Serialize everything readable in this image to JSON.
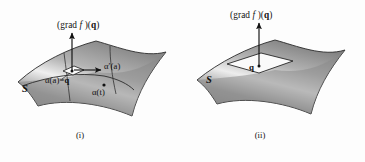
{
  "background_color": "#fdfdfd",
  "ink_color": "#111111",
  "surface": {
    "fill_light": "#f2f2f2",
    "fill_mid": "#9a9a9a",
    "fill_dark": "#6f6f6f",
    "outline": "#2b2b2b"
  },
  "figures": [
    {
      "id": "i",
      "caption": "(i)",
      "surface_label": "S",
      "gradient_vector_label": {
        "full": "(grad f )(q)",
        "prefix": "(grad ",
        "function": "f",
        "middle": " )(",
        "point": "q",
        "suffix": ")"
      },
      "tangent_vector_label": {
        "full": "α′(a)",
        "alpha": "α",
        "prime": "′",
        "arg": "(a)"
      },
      "base_point_label": {
        "full": "α(a)=q",
        "alpha_arg": "α(a)=",
        "point": "q"
      },
      "curve_label": {
        "full": "α(t)",
        "text": "α(t)"
      }
    },
    {
      "id": "ii",
      "caption": "(ii)",
      "surface_label": "S",
      "gradient_vector_label": {
        "full": "(grad f )(q)",
        "prefix": "(grad ",
        "function": "f",
        "middle": " )(",
        "point": "q",
        "suffix": ")"
      },
      "point_label": "q"
    }
  ]
}
